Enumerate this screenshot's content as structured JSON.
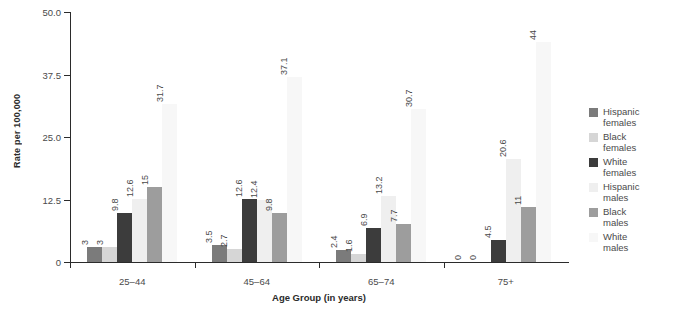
{
  "chart_data": {
    "type": "bar",
    "title": "",
    "xlabel": "Age Group (in years)",
    "ylabel": "Rate per 100,000",
    "ylim": [
      0,
      50
    ],
    "yticks": [
      "0",
      "12.5",
      "25.0",
      "37.5",
      "50.0"
    ],
    "ytick_values": [
      0,
      12.5,
      25,
      37.5,
      50
    ],
    "grid": false,
    "legend_position": "right",
    "categories": [
      "25–44",
      "45–64",
      "65–74",
      "75+"
    ],
    "series": [
      {
        "name": "Hispanic females",
        "color": "#7b7b7b",
        "values": [
          3,
          3.5,
          2.4,
          0
        ],
        "labels": [
          "3",
          "3.5",
          "2.4",
          "0"
        ]
      },
      {
        "name": "Black females",
        "color": "#d6d6d6",
        "values": [
          3,
          2.7,
          1.6,
          0
        ],
        "labels": [
          "3",
          "2.7",
          "1.6",
          "0"
        ]
      },
      {
        "name": "White females",
        "color": "#3c3c3c",
        "values": [
          9.8,
          12.6,
          6.9,
          4.5
        ],
        "labels": [
          "9.8",
          "12.6",
          "6.9",
          "4.5"
        ]
      },
      {
        "name": "Hispanic males",
        "color": "#efefef",
        "values": [
          12.6,
          12.4,
          13.2,
          20.6
        ],
        "labels": [
          "12.6",
          "12.4",
          "13.2",
          "20.6"
        ]
      },
      {
        "name": "Black males",
        "color": "#9d9d9d",
        "values": [
          15,
          9.8,
          7.7,
          11
        ],
        "labels": [
          "15",
          "9.8",
          "7.7",
          "11"
        ]
      },
      {
        "name": "White males",
        "color": "#f7f7f7",
        "values": [
          31.7,
          37.1,
          30.7,
          44
        ],
        "labels": [
          "31.7",
          "37.1",
          "30.7",
          "44"
        ]
      }
    ]
  },
  "legend": {
    "items": [
      {
        "label_line1": "Hispanic",
        "label_line2": "females",
        "color": "#7b7b7b"
      },
      {
        "label_line1": "Black",
        "label_line2": "females",
        "color": "#d6d6d6"
      },
      {
        "label_line1": "White",
        "label_line2": "females",
        "color": "#3c3c3c"
      },
      {
        "label_line1": "Hispanic",
        "label_line2": "males",
        "color": "#efefef"
      },
      {
        "label_line1": "Black",
        "label_line2": "males",
        "color": "#9d9d9d"
      },
      {
        "label_line1": "White",
        "label_line2": "males",
        "color": "#f7f7f7"
      }
    ]
  }
}
